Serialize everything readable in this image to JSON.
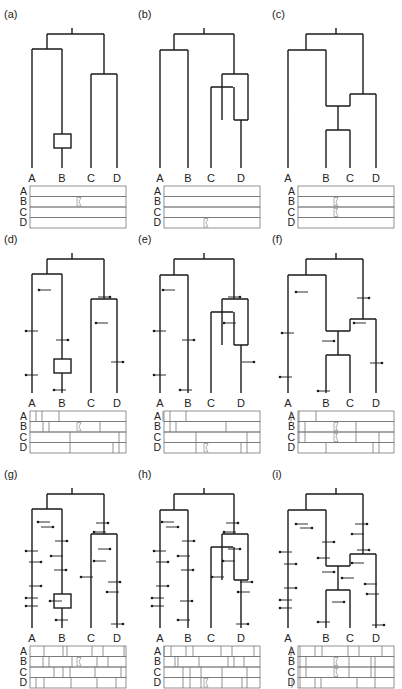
{
  "figure": {
    "panels": [
      {
        "id": "a",
        "label": "(a)",
        "leaves": [
          "A",
          "B",
          "C",
          "D"
        ],
        "topology": "((A,B),(C,D))",
        "feature": "box-on-B",
        "mutations": 0,
        "table_rows": [
          "A",
          "B",
          "C",
          "D"
        ],
        "breakpoint": "B-C"
      },
      {
        "id": "b",
        "label": "(b)",
        "leaves": [
          "A",
          "B",
          "C",
          "D"
        ],
        "topology": "((A,B),(C,D)) with reticulation on D",
        "feature": "loop-on-D",
        "mutations": 0,
        "table_rows": [
          "A",
          "B",
          "C",
          "D"
        ],
        "breakpoint": "D-bottom"
      },
      {
        "id": "c",
        "label": "(c)",
        "leaves": [
          "A",
          "B",
          "C",
          "D"
        ],
        "topology": "(A,(B,C),D) reticulate",
        "feature": "hybrid-BC",
        "mutations": 0,
        "table_rows": [
          "A",
          "B",
          "C",
          "D"
        ],
        "breakpoint": "B-C-D"
      },
      {
        "id": "d",
        "label": "(d)",
        "leaves": [
          "A",
          "B",
          "C",
          "D"
        ],
        "topology": "((A,B),(C,D))",
        "feature": "box-on-B",
        "mutations": 8,
        "table_rows": [
          "A",
          "B",
          "C",
          "D"
        ],
        "breakpoint": "B-C"
      },
      {
        "id": "e",
        "label": "(e)",
        "leaves": [
          "A",
          "B",
          "C",
          "D"
        ],
        "topology": "((A,B),(C,D)) with reticulation on D",
        "feature": "loop-on-D",
        "mutations": 8,
        "table_rows": [
          "A",
          "B",
          "C",
          "D"
        ],
        "breakpoint": "D-bottom"
      },
      {
        "id": "f",
        "label": "(f)",
        "leaves": [
          "A",
          "B",
          "C",
          "D"
        ],
        "topology": "(A,(B,C),D) reticulate",
        "feature": "hybrid-BC",
        "mutations": 8,
        "table_rows": [
          "A",
          "B",
          "C",
          "D"
        ],
        "breakpoint": "B-C-D"
      },
      {
        "id": "g",
        "label": "(g)",
        "leaves": [
          "A",
          "B",
          "C",
          "D"
        ],
        "topology": "((A,B),(C,D))",
        "feature": "box-on-B",
        "mutations": 20,
        "table_rows": [
          "A",
          "B",
          "C",
          "D"
        ],
        "breakpoint": "B-C"
      },
      {
        "id": "h",
        "label": "(h)",
        "leaves": [
          "A",
          "B",
          "C",
          "D"
        ],
        "topology": "((A,B),(C,D)) with reticulation on D",
        "feature": "loop-on-D",
        "mutations": 20,
        "table_rows": [
          "A",
          "B",
          "C",
          "D"
        ],
        "breakpoint": "D-bottom"
      },
      {
        "id": "i",
        "label": "(i)",
        "leaves": [
          "A",
          "B",
          "C",
          "D"
        ],
        "topology": "(A,(B,C),D) reticulate",
        "feature": "hybrid-BC",
        "mutations": 20,
        "table_rows": [
          "A",
          "B",
          "C",
          "D"
        ],
        "breakpoint": "B-C-D"
      }
    ]
  },
  "colors": {
    "line": "#1a1a1a",
    "grid": "#777777",
    "marker": "#999999"
  }
}
